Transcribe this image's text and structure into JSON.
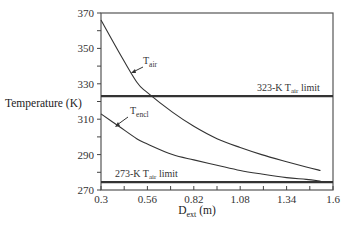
{
  "chart_data": {
    "type": "line",
    "title": "",
    "xlabel": "D_ext (m)",
    "xlabel_main": "D",
    "xlabel_sub": "ext",
    "xlabel_unit": " (m)",
    "ylabel": "Temperature (K)",
    "xlim": [
      0.3,
      1.6
    ],
    "ylim": [
      270,
      370
    ],
    "x_ticks": [
      "0.3",
      "0.56",
      "0.82",
      "1.08",
      "1.34",
      "1.6"
    ],
    "y_ticks": [
      "370",
      "350",
      "330",
      "310",
      "290",
      "270"
    ],
    "grid": false,
    "series": [
      {
        "name": "T_air",
        "label_main": "T",
        "label_sub": "air",
        "x": [
          0.3,
          0.4,
          0.5,
          0.56,
          0.7,
          0.82,
          0.95,
          1.08,
          1.2,
          1.34,
          1.45,
          1.53
        ],
        "y": [
          366,
          348,
          331,
          325,
          314,
          306,
          299,
          294,
          290,
          286,
          283,
          281
        ]
      },
      {
        "name": "T_encl",
        "label_main": "T",
        "label_sub": "encl",
        "x": [
          0.3,
          0.4,
          0.5,
          0.56,
          0.7,
          0.82,
          0.95,
          1.08,
          1.2,
          1.34,
          1.45,
          1.53
        ],
        "y": [
          313,
          306,
          299,
          296,
          290,
          287,
          284,
          281,
          279,
          277,
          276,
          275
        ]
      }
    ],
    "reference_lines": [
      {
        "name": "323-K T_air limit",
        "value": 323,
        "label_pre": "323-K T",
        "label_sub": "air",
        "label_post": " limit"
      },
      {
        "name": "273-K T_air limit",
        "value": 274.5,
        "label_pre": "273-K T",
        "label_sub": "air",
        "label_post": " limit"
      }
    ]
  }
}
